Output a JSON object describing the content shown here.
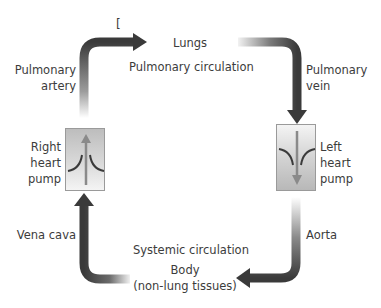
{
  "diagram": {
    "title_mark": "[",
    "nodes": {
      "lungs": "Lungs",
      "body_line1": "Body",
      "body_line2": "(non-lung tissues)",
      "right_pump": [
        "Right",
        "heart",
        "pump"
      ],
      "left_pump": [
        "Left",
        "heart",
        "pump"
      ]
    },
    "circuits": {
      "pulmonary": "Pulmonary circulation",
      "systemic": "Systemic circulation"
    },
    "vessels": {
      "pulmonary_artery": [
        "Pulmonary",
        "artery"
      ],
      "pulmonary_vein": [
        "Pulmonary",
        "vein"
      ],
      "aorta": "Aorta",
      "vena_cava": "Vena cava"
    },
    "colors": {
      "arrow_dark": "#3a3a3a",
      "arrow_light": "#e6e6e6",
      "pump_border": "#9a9a9a",
      "pump_arrow": "#8a8a8a",
      "text": "#3c3c3c"
    }
  }
}
